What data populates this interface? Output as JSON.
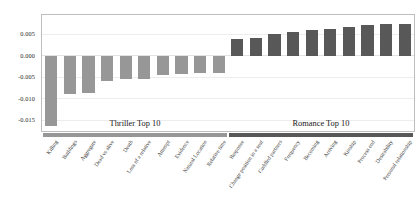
{
  "chart_data": {
    "type": "bar",
    "title": "",
    "xlabel": "",
    "ylabel": "",
    "ylim": [
      -0.0175,
      0.0095
    ],
    "yticks": [
      0.005,
      0.0,
      -0.005,
      -0.01,
      -0.015
    ],
    "ytick_labels": [
      "0.005",
      "0.000",
      "-0.005",
      "-0.010",
      "-0.015"
    ],
    "grid": true,
    "legend": "none",
    "orientation": "vertical",
    "groups": [
      {
        "name": "Thriller Top 10",
        "label": "Thriller Top 10",
        "color": "#979797"
      },
      {
        "name": "Romance Top 10",
        "label": "Romance Top 10",
        "color": "#585858"
      }
    ],
    "categories": [
      "Killing",
      "Buildings",
      "Aggregate",
      "Dead vs alive",
      "Death",
      "Loss of a relative",
      "Attempt",
      "Evidence",
      "Natural Location",
      "Relative time",
      "Response",
      "Change position in a seat",
      "Cuddled partners",
      "Frequency",
      "Becoming",
      "Arriving",
      "Kinship",
      "Process end",
      "Desirability",
      "Personal relationship"
    ],
    "values": [
      -0.0163,
      -0.0089,
      -0.0087,
      -0.0059,
      -0.0055,
      -0.0053,
      -0.0044,
      -0.0042,
      -0.0041,
      -0.0039,
      0.0038,
      0.0041,
      0.005,
      0.0055,
      0.0059,
      0.0063,
      0.0068,
      0.0071,
      0.0073,
      0.0075
    ],
    "group_of": [
      0,
      0,
      0,
      0,
      0,
      0,
      0,
      0,
      0,
      0,
      1,
      1,
      1,
      1,
      1,
      1,
      1,
      1,
      1,
      1
    ]
  }
}
